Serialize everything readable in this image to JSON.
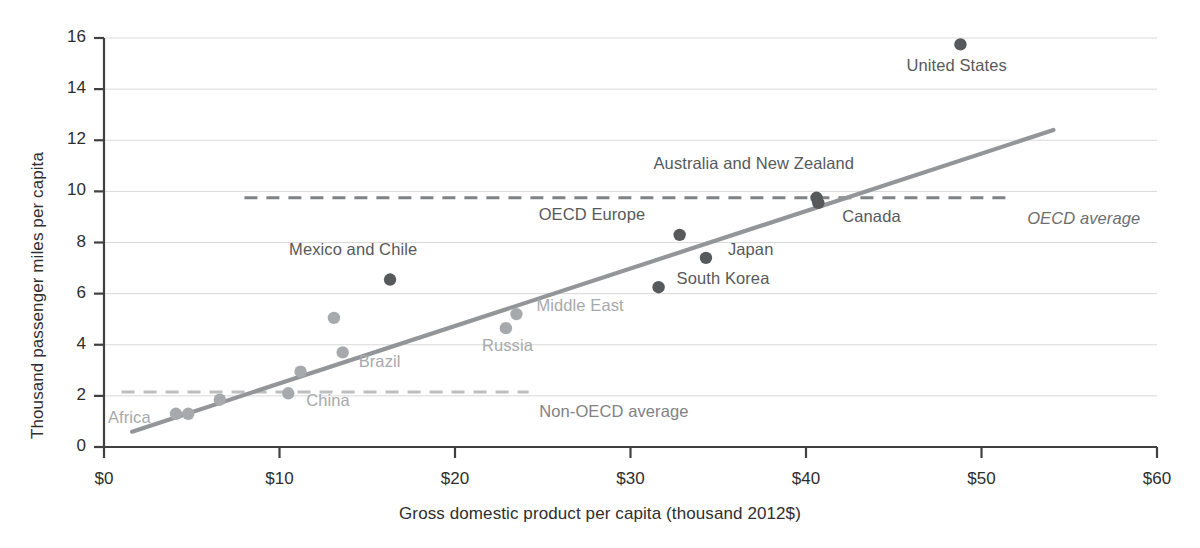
{
  "chart_data": {
    "type": "scatter",
    "title": "",
    "xlabel": "Gross domestic product per capita (thousand 2012$)",
    "ylabel": "Thousand passenger miles per capita",
    "xlim": [
      0,
      60
    ],
    "ylim": [
      0,
      16
    ],
    "xticks": [
      0,
      10,
      20,
      30,
      40,
      50,
      60
    ],
    "xticklabels": [
      "$0",
      "$10",
      "$20",
      "$30",
      "$40",
      "$50",
      "$60"
    ],
    "yticks": [
      0,
      2,
      4,
      6,
      8,
      10,
      12,
      14,
      16
    ],
    "yticklabels": [
      "0",
      "2",
      "4",
      "6",
      "8",
      "10",
      "12",
      "14",
      "16"
    ],
    "grid": "horizontal",
    "legend": "none",
    "colors": {
      "oecd_point": "#58595b",
      "nonoecd_point": "#a7a9ac",
      "trend_line": "#939598",
      "oecd_average_line": "#808285",
      "nonoecd_average_line": "#bcbec0",
      "gridline": "#d9d9d9",
      "axis": "#414042",
      "text": "#2e2e2e"
    },
    "points": [
      {
        "name": "Africa",
        "group": "non-OECD",
        "x": 4.1,
        "y": 1.3,
        "label": "Africa",
        "label_dx": -68,
        "label_dy": 4
      },
      {
        "name": "Africa-2",
        "group": "non-OECD",
        "x": 4.8,
        "y": 1.3,
        "label": "",
        "label_dx": 0,
        "label_dy": 0
      },
      {
        "name": "Unlabeled-6.6",
        "group": "non-OECD",
        "x": 6.6,
        "y": 1.85,
        "label": "",
        "label_dx": 0,
        "label_dy": 0
      },
      {
        "name": "China",
        "group": "non-OECD",
        "x": 10.5,
        "y": 2.1,
        "label": "China",
        "label_dx": 18,
        "label_dy": 8
      },
      {
        "name": "Unlabeled-11.2",
        "group": "non-OECD",
        "x": 11.2,
        "y": 2.95,
        "label": "",
        "label_dx": 0,
        "label_dy": 0
      },
      {
        "name": "Unlabeled-13.1",
        "group": "non-OECD",
        "x": 13.1,
        "y": 5.05,
        "label": "",
        "label_dx": 0,
        "label_dy": 0
      },
      {
        "name": "Brazil",
        "group": "non-OECD",
        "x": 13.6,
        "y": 3.7,
        "label": "Brazil",
        "label_dx": 16,
        "label_dy": 10
      },
      {
        "name": "Mexico and Chile",
        "group": "OECD",
        "x": 16.3,
        "y": 6.55,
        "label": "Mexico and Chile",
        "label_dx": -101,
        "label_dy": -30
      },
      {
        "name": "Russia",
        "group": "non-OECD",
        "x": 22.9,
        "y": 4.65,
        "label": "Russia",
        "label_dx": -24,
        "label_dy": 18
      },
      {
        "name": "Middle East",
        "group": "non-OECD",
        "x": 23.5,
        "y": 5.2,
        "label": "Middle East",
        "label_dx": 20,
        "label_dy": -8
      },
      {
        "name": "South Korea",
        "group": "OECD",
        "x": 31.6,
        "y": 6.25,
        "label": "South Korea",
        "label_dx": 18,
        "label_dy": -8
      },
      {
        "name": "OECD Europe",
        "group": "OECD",
        "x": 32.8,
        "y": 8.3,
        "label": "OECD Europe",
        "label_dx": -141,
        "label_dy": -20
      },
      {
        "name": "Japan",
        "group": "OECD",
        "x": 34.3,
        "y": 7.4,
        "label": "Japan",
        "label_dx": 22,
        "label_dy": -8
      },
      {
        "name": "Australia and New Zealand",
        "group": "OECD",
        "x": 40.6,
        "y": 9.75,
        "label": "Australia and New Zealand",
        "label_dx": -163,
        "label_dy": -34
      },
      {
        "name": "Canada",
        "group": "OECD",
        "x": 40.7,
        "y": 9.55,
        "label": "Canada",
        "label_dx": 24,
        "label_dy": 14
      },
      {
        "name": "United States",
        "group": "OECD",
        "x": 48.8,
        "y": 15.75,
        "label": "United States",
        "label_dx": -54,
        "label_dy": 22
      }
    ],
    "trend_line": {
      "name": "regression-line",
      "x1": 1.6,
      "y1": 0.6,
      "x2": 54.1,
      "y2": 12.4
    },
    "reference_lines": [
      {
        "name": "OECD average",
        "label": "OECD average",
        "value": 9.75,
        "x1": 8.0,
        "x2": 51.4,
        "style": "dashed",
        "label_x": 52.6,
        "label_y": 8.9
      },
      {
        "name": "Non-OECD average",
        "label": "Non-OECD average",
        "value": 2.15,
        "x1": 1.0,
        "x2": 24.2,
        "style": "dashed",
        "label_x": 24.8,
        "label_y": 1.35
      }
    ]
  }
}
